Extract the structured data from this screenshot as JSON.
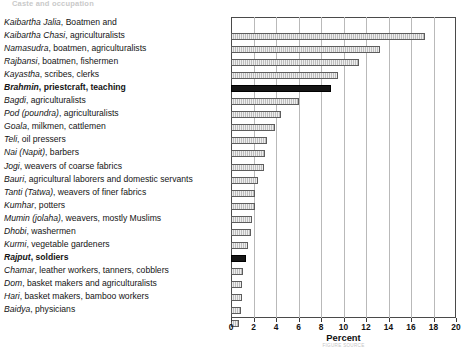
{
  "page": {
    "header_faint": "Caste and occupation"
  },
  "chart_data": {
    "type": "bar",
    "orientation": "horizontal",
    "title": "",
    "xlabel": "Percent",
    "ylabel": "",
    "xlim": [
      0,
      20
    ],
    "xticks": [
      0,
      2,
      4,
      6,
      8,
      10,
      12,
      14,
      16,
      18,
      20
    ],
    "grid": true,
    "legend": null,
    "categories": [
      "Kaibartha Jalia, Boatmen and",
      "Kaibartha Chasi, agriculturalists",
      "Namasudra, boatmen, agriculturalists",
      "Rajbansi, boatmen, fishermen",
      "Kayastha, scribes, clerks",
      "Brahmin, priestcraft, teaching",
      "Bagdi, agriculturalists",
      "Pod (poundra), agriculturalists",
      "Goala, milkmen, cattlemen",
      "Teli, oil pressers",
      "Nai (Napit), barbers",
      "Jogi, weavers of coarse fabrics",
      "Bauri, agricultural laborers and domestic servants",
      "Tanti (Tatwa), weavers of finer fabrics",
      "Kumhar, potters",
      "Mumin (jolaha), weavers, mostly Muslims",
      "Dhobi, washermen",
      "Kurmi, vegetable gardeners",
      "Rajput, soldiers",
      "Chamar, leather workers, tanners, cobblers",
      "Dom, basket makers and agriculturalists",
      "Hari, basket makers, bamboo workers",
      "Baidya, physicians"
    ],
    "values": [
      17.2,
      13.2,
      11.4,
      9.5,
      8.9,
      6.0,
      4.4,
      3.9,
      3.2,
      3.0,
      2.9,
      2.4,
      2.1,
      2.1,
      1.9,
      1.8,
      1.5,
      1.3,
      1.1,
      1.0,
      1.0,
      0.9,
      0.7
    ],
    "highlighted": [
      "Brahmin, priestcraft, teaching",
      "Rajput, soldiers"
    ],
    "colors": {
      "bar_fill": "#bdbdbd",
      "bar_border": "#5d5d5d",
      "bar_highlight": "#151515",
      "gridline": "#b9b9b9",
      "frame": "#4a4a4a"
    }
  },
  "labels": [
    {
      "italic": "Kaibartha Jalia",
      "rest": ", Boatmen and",
      "bold": false,
      "bar_index": null
    },
    {
      "italic": "Kaibartha Chasi",
      "rest": ", agriculturalists",
      "bold": false,
      "bar_index": 0
    },
    {
      "italic": "Namasudra",
      "rest": ", boatmen, agriculturalists",
      "bold": false,
      "bar_index": 1
    },
    {
      "italic": "Rajbansi",
      "rest": ", boatmen, fishermen",
      "bold": false,
      "bar_index": 2
    },
    {
      "italic": "Kayastha",
      "rest": ", scribes, clerks",
      "bold": false,
      "bar_index": 3
    },
    {
      "italic": "Brahmin",
      "rest": ", priestcraft, teaching",
      "bold": true,
      "bar_index": 4
    },
    {
      "italic": "Bagdi",
      "rest": ", agriculturalists",
      "bold": false,
      "bar_index": 5
    },
    {
      "italic": "Pod (poundra)",
      "rest": ", agriculturalists",
      "bold": false,
      "bar_index": 6
    },
    {
      "italic": "Goala",
      "rest": ", milkmen, cattlemen",
      "bold": false,
      "bar_index": 7
    },
    {
      "italic": "Teli",
      "rest": ", oil pressers",
      "bold": false,
      "bar_index": 8
    },
    {
      "italic": "Nai (Napit)",
      "rest": ", barbers",
      "bold": false,
      "bar_index": 9
    },
    {
      "italic": "Jogi",
      "rest": ", weavers of coarse fabrics",
      "bold": false,
      "bar_index": 10
    },
    {
      "italic": "Bauri",
      "rest": ", agricultural laborers and domestic servants",
      "bold": false,
      "bar_index": 11
    },
    {
      "italic": "Tanti (Tatwa)",
      "rest": ", weavers of finer fabrics",
      "bold": false,
      "bar_index": 12
    },
    {
      "italic": "Kumhar",
      "rest": ", potters",
      "bold": false,
      "bar_index": 13
    },
    {
      "italic": "Mumin (jolaha)",
      "rest": ", weavers, mostly Muslims",
      "bold": false,
      "bar_index": 14
    },
    {
      "italic": "Dhobi",
      "rest": ", washermen",
      "bold": false,
      "bar_index": 15
    },
    {
      "italic": "Kurmi",
      "rest": ", vegetable gardeners",
      "bold": false,
      "bar_index": 16
    },
    {
      "italic": "Rajput",
      "rest": ", soldiers",
      "bold": true,
      "bar_index": 17
    },
    {
      "italic": "Chamar",
      "rest": ", leather workers, tanners, cobblers",
      "bold": false,
      "bar_index": 18
    },
    {
      "italic": "Dom",
      "rest": ", basket makers and agriculturalists",
      "bold": false,
      "bar_index": 19
    },
    {
      "italic": "Hari",
      "rest": ", basket makers, bamboo workers",
      "bold": false,
      "bar_index": 20
    },
    {
      "italic": "Baidya",
      "rest": ", physicians",
      "bold": false,
      "bar_index": 21
    }
  ],
  "axis": {
    "title": "Percent",
    "subnote": "FIGURE SOURCE"
  }
}
